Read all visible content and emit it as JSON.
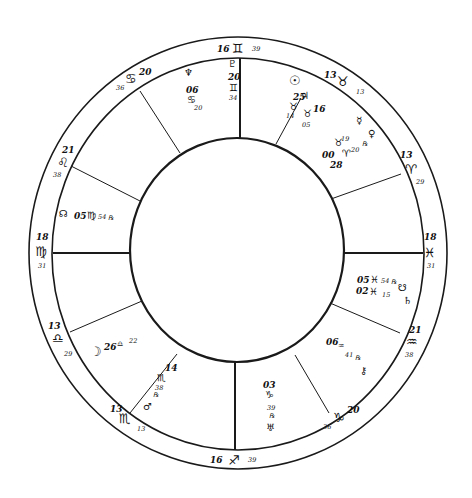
{
  "chart": {
    "type": "natal-wheel",
    "houses_count": 12,
    "colors": {
      "ink": "#1a1a1a",
      "background": "#ffffff"
    }
  },
  "cusps": [
    {
      "id": "mc",
      "deg": "16",
      "sign_icon": "gemini-icon",
      "sign": "♊",
      "min": "39"
    },
    {
      "id": "c11",
      "deg": "13",
      "sign_icon": "taurus-icon",
      "sign": "♉",
      "min": "13"
    },
    {
      "id": "c12",
      "deg": "13",
      "sign_icon": "aries-icon",
      "sign": "♈",
      "min": "29"
    },
    {
      "id": "dsc",
      "deg": "18",
      "sign_icon": "pisces-icon",
      "sign": "♓",
      "min": "31"
    },
    {
      "id": "c8",
      "deg": "21",
      "sign_icon": "aquarius-icon",
      "sign": "♒",
      "min": "38"
    },
    {
      "id": "c7",
      "deg": "20",
      "sign_icon": "capricorn-icon",
      "sign": "♑",
      "min": "36"
    },
    {
      "id": "ic",
      "deg": "16",
      "sign_icon": "sagittarius-icon",
      "sign": "♐",
      "min": "39"
    },
    {
      "id": "c5",
      "deg": "13",
      "sign_icon": "scorpio-icon",
      "sign": "♏",
      "min": "13"
    },
    {
      "id": "c4",
      "deg": "13",
      "sign_icon": "libra-icon",
      "sign": "♎",
      "min": "29"
    },
    {
      "id": "asc",
      "deg": "18",
      "sign_icon": "virgo-icon",
      "sign": "♍",
      "min": "31"
    },
    {
      "id": "c2",
      "deg": "21",
      "sign_icon": "leo-icon",
      "sign": "♌",
      "min": "38"
    },
    {
      "id": "c1",
      "deg": "20",
      "sign_icon": "cancer-icon",
      "sign": "♋",
      "min": "36"
    }
  ],
  "planets": {
    "pluto": {
      "icon": "pluto-icon",
      "glyph": "♇",
      "deg": "20",
      "sign": "♊",
      "min": "34"
    },
    "neptune": {
      "icon": "neptune-icon",
      "glyph": "♆",
      "deg": "06",
      "sign": "♋",
      "min": "20"
    },
    "sun": {
      "icon": "sun-icon",
      "glyph": "☉"
    },
    "jupiter": {
      "icon": "jupiter-icon",
      "glyph": "♃"
    },
    "taurus_a": {
      "deg": "25",
      "sign": "♉",
      "min": "14"
    },
    "taurus_b": {
      "deg": "16",
      "sign": "♉",
      "min": "05"
    },
    "mercury": {
      "icon": "mercury-icon",
      "glyph": "☿"
    },
    "venus": {
      "icon": "venus-icon",
      "glyph": "♀",
      "retro": "℞"
    },
    "aries_a": {
      "deg": "19",
      "sign": "♉",
      "min": ""
    },
    "aries_b": {
      "deg": "00",
      "sign": "♈",
      "min": "20"
    },
    "aries_c": {
      "deg": "28"
    },
    "north_node": {
      "icon": "north-node-icon",
      "glyph": "☊",
      "deg": "05",
      "sign": "♍",
      "min": "54",
      "retro": "℞"
    },
    "south_node": {
      "icon": "south-node-icon",
      "glyph": "☋",
      "deg": "05",
      "sign": "♓",
      "min": "54",
      "retro": "℞"
    },
    "saturn": {
      "icon": "saturn-icon",
      "glyph": "♄",
      "deg": "02",
      "sign": "♓",
      "min": "15"
    },
    "chiron": {
      "icon": "chiron-icon",
      "glyph": "⚷",
      "deg": "06",
      "sign": "♒",
      "min": "41",
      "retro": "℞"
    },
    "uranus": {
      "icon": "uranus-icon",
      "glyph": "♅",
      "deg": "03",
      "sign": "♑",
      "min": "39",
      "retro": "℞"
    },
    "mars": {
      "icon": "mars-icon",
      "glyph": "♂",
      "deg": "14",
      "sign": "♏",
      "min": "38",
      "retro": "℞"
    },
    "moon": {
      "icon": "moon-icon",
      "glyph": "☽",
      "deg": "26",
      "sign": "♎",
      "min": "22"
    }
  }
}
